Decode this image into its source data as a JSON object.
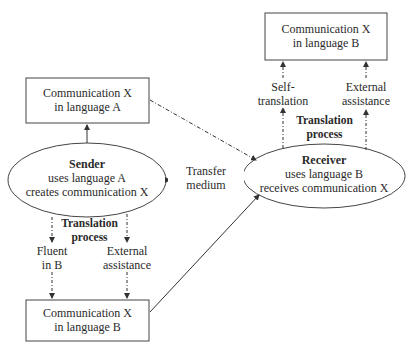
{
  "boxes": {
    "top_right": {
      "line1": "Communication X",
      "line2": "in language B"
    },
    "left_a": {
      "line1": "Communication X",
      "line2": "in language A"
    },
    "bottom_b": {
      "line1": "Communication X",
      "line2": "in language B"
    }
  },
  "sender": {
    "title": "Sender",
    "line1": "uses language A",
    "line2": "creates communication X"
  },
  "receiver": {
    "title": "Receiver",
    "line1": "uses language B",
    "line2": "receives communication X"
  },
  "transfer": {
    "line1": "Transfer",
    "line2": "medium"
  },
  "sender_translation": {
    "title1": "Translation",
    "title2": "process",
    "left1": "Fluent",
    "left2": "in B",
    "right1": "External",
    "right2": "assistance"
  },
  "receiver_translation": {
    "title1": "Translation",
    "title2": "process",
    "left1": "Self-",
    "left2": "translation",
    "right1": "External",
    "right2": "assistance"
  },
  "colors": {
    "stroke": "#333333",
    "text": "#2a2a2a",
    "background": "#ffffff"
  }
}
